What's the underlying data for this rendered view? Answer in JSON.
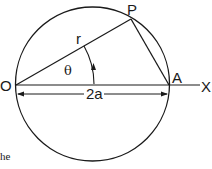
{
  "diagram": {
    "labels": {
      "origin": "O",
      "point_p": "P",
      "point_a": "A",
      "axis": "X",
      "radius": "r",
      "angle": "θ",
      "diameter": "2a"
    },
    "caption_fragment": "he",
    "colors": {
      "stroke": "#1a1a1a",
      "background": "#ffffff"
    }
  }
}
